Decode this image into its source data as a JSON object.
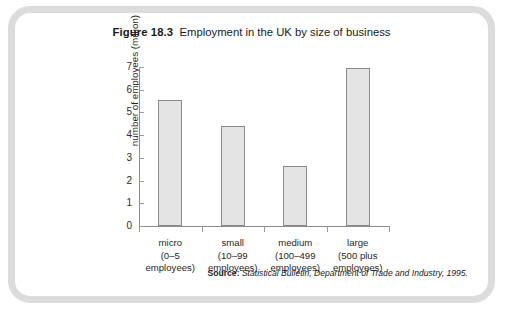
{
  "figure": {
    "label": "Figure 18.3",
    "caption": "Employment in the UK by size of business",
    "source_label": "Source:",
    "source_text": "Statistical Bulletin, Department of Trade and Industry, 1995."
  },
  "colors": {
    "frame": "#dcdcdc",
    "bar_fill": "#e4e4e4",
    "bar_border": "#8a8a8a",
    "axis": "#8c8c8c",
    "text": "#1a1a1a",
    "background": "#ffffff"
  },
  "chart_data": {
    "type": "bar",
    "title": "Employment in the UK by size of business",
    "xlabel": "",
    "ylabel": "number of employees (million)",
    "categories": [
      "micro (0–5 employees)",
      "small (10–99 employees)",
      "medium (100–499 employees)",
      "large (500 plus employees)"
    ],
    "category_lines": [
      [
        "micro",
        "(0–5",
        "employees)"
      ],
      [
        "small",
        "(10–99",
        "employees)"
      ],
      [
        "medium",
        "(100–499",
        "employees)"
      ],
      [
        "large",
        "(500 plus",
        "employees)"
      ]
    ],
    "values": [
      5.55,
      4.4,
      2.65,
      6.95
    ],
    "ylim": [
      0,
      7
    ],
    "yticks": [
      0,
      1,
      2,
      3,
      4,
      5,
      6,
      7
    ],
    "ytick_labels": [
      "0",
      "1",
      "2",
      "3",
      "4",
      "5",
      "6",
      "7"
    ],
    "grid": false,
    "legend": null
  }
}
